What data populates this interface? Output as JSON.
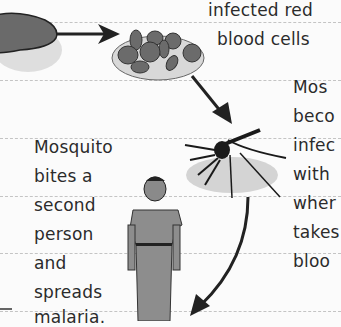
{
  "diagram": {
    "title_fragment_top": [
      "infected red",
      "blood cells"
    ],
    "right_text": [
      "Mos",
      "beco",
      "infec",
      "with",
      "wher",
      "takes",
      "bloo"
    ],
    "left_text": [
      "Mosquito",
      "bites a",
      "second",
      "person",
      "and",
      "spreads",
      "malaria."
    ],
    "stages": [
      "liver",
      "infected red blood cells",
      "mosquito",
      "second person"
    ],
    "colors": {
      "ink": "#2b2b2b",
      "cell": "#6b6b6b",
      "plate": "#d9d9d9",
      "rule": "#c4c4c4"
    }
  }
}
